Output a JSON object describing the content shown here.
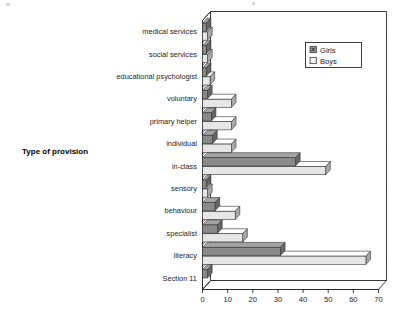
{
  "chart_data": {
    "type": "bar",
    "orientation": "horizontal",
    "title": "",
    "xlabel": "",
    "ylabel": "Type of provision",
    "xlim": [
      0,
      70
    ],
    "xticks": [
      0,
      10,
      20,
      30,
      40,
      50,
      60,
      70
    ],
    "grid": true,
    "legend_position": "top-right",
    "categories": [
      "medical services",
      "social services",
      "educational psychologist",
      "voluntary",
      "primary helper",
      "individual",
      "in-class",
      "sensory",
      "behaviour",
      "specialist",
      "literacy",
      "Section 11"
    ],
    "series": [
      {
        "name": "Girls",
        "color": "#8a8a8a",
        "values": [
          1.5,
          1.5,
          1.5,
          2,
          3.5,
          4,
          37,
          1.5,
          5,
          6,
          31,
          2
        ]
      },
      {
        "name": "Boys",
        "color": "#e6e6e6",
        "values": [
          2,
          2,
          3,
          11.5,
          11.5,
          11.5,
          49,
          2,
          13,
          16,
          65,
          0
        ]
      }
    ]
  },
  "axis": {
    "y_title": "Type of provision"
  },
  "legend": {
    "items": [
      {
        "label": "Girls",
        "swatch": "dark"
      },
      {
        "label": "Boys",
        "swatch": "light"
      }
    ]
  }
}
